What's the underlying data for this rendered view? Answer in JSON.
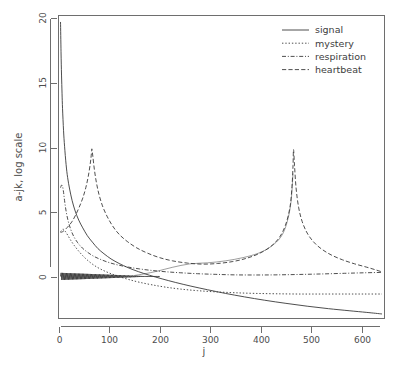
{
  "chart_data": {
    "type": "line",
    "title": "",
    "xlabel": "j",
    "ylabel": "a-jk, log scale",
    "xlim": [
      0,
      645
    ],
    "ylim": [
      -3.2,
      20.2
    ],
    "xticks": [
      0,
      100,
      200,
      300,
      400,
      500,
      600
    ],
    "yticks": [
      0,
      5,
      10,
      15,
      20
    ],
    "xtick_labels": [
      "0",
      "100",
      "200",
      "300",
      "400",
      "500",
      "600"
    ],
    "ytick_labels": [
      "0",
      "5",
      "10",
      "15",
      "20"
    ],
    "grid": false,
    "legend_position": "top-right",
    "series": [
      {
        "name": "signal",
        "style": "solid",
        "peak_x": 4,
        "peak_y": 19.7,
        "end_y": -2.85,
        "points": [
          [
            4,
            19.7
          ],
          [
            5,
            17.4
          ],
          [
            6,
            15.6
          ],
          [
            7,
            14.2
          ],
          [
            8,
            13.0
          ],
          [
            10,
            11.3
          ],
          [
            12,
            10.1
          ],
          [
            15,
            8.7
          ],
          [
            18,
            7.7
          ],
          [
            22,
            6.8
          ],
          [
            27,
            5.9
          ],
          [
            33,
            5.1
          ],
          [
            40,
            4.4
          ],
          [
            48,
            3.8
          ],
          [
            57,
            3.2
          ],
          [
            67,
            2.7
          ],
          [
            78,
            2.2
          ],
          [
            90,
            1.8
          ],
          [
            104,
            1.4
          ],
          [
            120,
            1.05
          ],
          [
            138,
            0.72
          ],
          [
            158,
            0.42
          ],
          [
            180,
            0.14
          ],
          [
            205,
            -0.14
          ],
          [
            232,
            -0.42
          ],
          [
            262,
            -0.7
          ],
          [
            295,
            -0.98
          ],
          [
            330,
            -1.26
          ],
          [
            368,
            -1.53
          ],
          [
            408,
            -1.79
          ],
          [
            450,
            -2.03
          ],
          [
            492,
            -2.25
          ],
          [
            534,
            -2.44
          ],
          [
            575,
            -2.6
          ],
          [
            610,
            -2.73
          ],
          [
            640,
            -2.85
          ]
        ]
      },
      {
        "name": "mystery",
        "style": "dotted",
        "start_y": 3.5,
        "peak_x": 66,
        "peak_y": 9.9,
        "end_y": -1.3,
        "points": [
          [
            4,
            3.5
          ],
          [
            6,
            3.6
          ],
          [
            9,
            3.7
          ],
          [
            13,
            3.55
          ],
          [
            18,
            3.25
          ],
          [
            24,
            2.85
          ],
          [
            31,
            2.45
          ],
          [
            39,
            2.05
          ],
          [
            48,
            1.65
          ],
          [
            58,
            1.28
          ],
          [
            70,
            0.92
          ],
          [
            84,
            0.6
          ],
          [
            100,
            0.32
          ],
          [
            118,
            0.06
          ],
          [
            138,
            -0.18
          ],
          [
            160,
            -0.4
          ],
          [
            185,
            -0.6
          ],
          [
            212,
            -0.78
          ],
          [
            242,
            -0.93
          ],
          [
            275,
            -1.05
          ],
          [
            310,
            -1.14
          ],
          [
            348,
            -1.21
          ],
          [
            388,
            -1.26
          ],
          [
            430,
            -1.29
          ],
          [
            475,
            -1.31
          ],
          [
            520,
            -1.31
          ],
          [
            566,
            -1.31
          ],
          [
            605,
            -1.31
          ],
          [
            640,
            -1.31
          ]
        ]
      },
      {
        "name": "respiration",
        "style": "dashdot",
        "peak_x": 10,
        "peak_y": 7.0,
        "end_y": 0.35,
        "points": [
          [
            4,
            6.9
          ],
          [
            6,
            7.1
          ],
          [
            8,
            7.0
          ],
          [
            10,
            6.55
          ],
          [
            12,
            5.9
          ],
          [
            15,
            5.1
          ],
          [
            19,
            4.35
          ],
          [
            24,
            3.7
          ],
          [
            30,
            3.15
          ],
          [
            38,
            2.65
          ],
          [
            47,
            2.25
          ],
          [
            58,
            1.9
          ],
          [
            70,
            1.6
          ],
          [
            84,
            1.35
          ],
          [
            100,
            1.12
          ],
          [
            118,
            0.93
          ],
          [
            138,
            0.77
          ],
          [
            160,
            0.63
          ],
          [
            185,
            0.51
          ],
          [
            212,
            0.41
          ],
          [
            242,
            0.33
          ],
          [
            275,
            0.26
          ],
          [
            310,
            0.21
          ],
          [
            348,
            0.17
          ],
          [
            388,
            0.16
          ],
          [
            430,
            0.17
          ],
          [
            475,
            0.2
          ],
          [
            520,
            0.24
          ],
          [
            566,
            0.29
          ],
          [
            605,
            0.33
          ],
          [
            640,
            0.36
          ]
        ]
      },
      {
        "name": "heartbeat",
        "style": "dashed",
        "peaks": [
          [
            66,
            9.9
          ],
          [
            465,
            9.85
          ]
        ],
        "end_y": 0.3,
        "points": [
          [
            4,
            3.45
          ],
          [
            8,
            3.5
          ],
          [
            14,
            3.7
          ],
          [
            20,
            3.95
          ],
          [
            27,
            4.3
          ],
          [
            34,
            4.8
          ],
          [
            41,
            5.4
          ],
          [
            48,
            6.1
          ],
          [
            54,
            6.9
          ],
          [
            59,
            7.8
          ],
          [
            63,
            8.8
          ],
          [
            65,
            9.5
          ],
          [
            66,
            9.9
          ],
          [
            68,
            9.3
          ],
          [
            71,
            8.3
          ],
          [
            75,
            7.3
          ],
          [
            80,
            6.4
          ],
          [
            87,
            5.5
          ],
          [
            96,
            4.7
          ],
          [
            107,
            3.95
          ],
          [
            120,
            3.3
          ],
          [
            136,
            2.75
          ],
          [
            155,
            2.25
          ],
          [
            176,
            1.85
          ],
          [
            200,
            1.5
          ],
          [
            226,
            1.25
          ],
          [
            255,
            1.08
          ],
          [
            285,
            1.0
          ],
          [
            315,
            1.05
          ],
          [
            345,
            1.2
          ],
          [
            372,
            1.45
          ],
          [
            396,
            1.8
          ],
          [
            418,
            2.3
          ],
          [
            436,
            3.0
          ],
          [
            449,
            4.0
          ],
          [
            458,
            5.4
          ],
          [
            462,
            7.0
          ],
          [
            464,
            8.6
          ],
          [
            465,
            9.85
          ],
          [
            467,
            8.6
          ],
          [
            470,
            6.9
          ],
          [
            475,
            5.4
          ],
          [
            482,
            4.3
          ],
          [
            492,
            3.4
          ],
          [
            505,
            2.7
          ],
          [
            521,
            2.15
          ],
          [
            540,
            1.7
          ],
          [
            562,
            1.33
          ],
          [
            586,
            1.02
          ],
          [
            610,
            0.76
          ],
          [
            628,
            0.55
          ],
          [
            640,
            0.4
          ]
        ]
      },
      {
        "name": "oscillating-dense",
        "style": "solid-dense",
        "description": "dense oscillating band near zero",
        "y_center": 0.05,
        "x_range": [
          4,
          200
        ]
      }
    ]
  },
  "legend": {
    "items": [
      {
        "label": "signal",
        "style": "solid"
      },
      {
        "label": "mystery",
        "style": "dotted"
      },
      {
        "label": "respiration",
        "style": "dashdot"
      },
      {
        "label": "heartbeat",
        "style": "dashed"
      }
    ]
  },
  "colors": {
    "line": "#3a3a3a",
    "axis": "#6e6e6e",
    "text": "#4d4d4d",
    "background": "#ffffff"
  }
}
